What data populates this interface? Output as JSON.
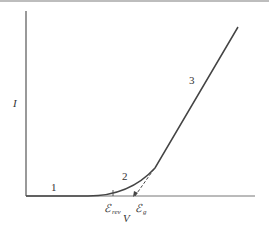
{
  "figure": {
    "y_axis_label": "I",
    "x_axis_label": "V",
    "region_labels": [
      "1",
      "2",
      "3"
    ],
    "markers": [
      {
        "symbol": "ℰ",
        "subscript": "rev"
      },
      {
        "symbol": "ℰ",
        "subscript": "g"
      }
    ],
    "colors": {
      "curve": "#444444",
      "axis": "#555555",
      "text": "#333333"
    }
  }
}
